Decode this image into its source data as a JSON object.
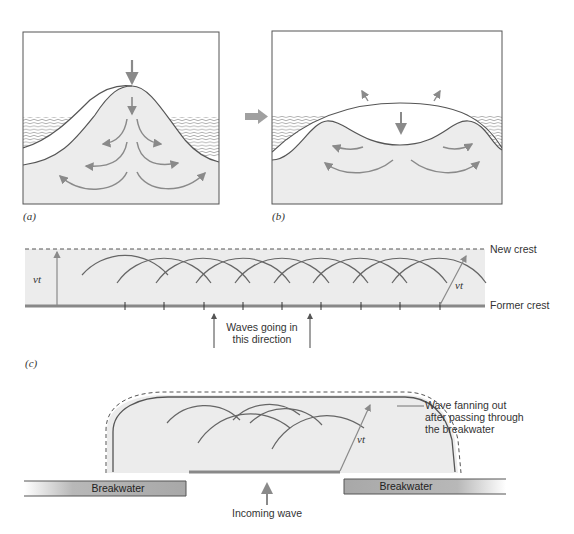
{
  "page_header": "",
  "colors": {
    "fill_light": "#eeeeee",
    "stroke_dark": "#555555",
    "arrow_gray": "#8a8a8a",
    "accent_arrow": "#9a9a9a"
  },
  "figures": {
    "a": {
      "caption": "(a)"
    },
    "b": {
      "caption": "(b)"
    },
    "c": {
      "caption": "(c)",
      "vt_left": "vt",
      "vt_right": "vt",
      "new_crest": "New crest",
      "former_crest": "Former crest",
      "direction_line1": "Waves going in",
      "direction_line2": "this direction"
    },
    "d": {
      "breakwater_left": "Breakwater",
      "breakwater_right": "Breakwater",
      "incoming_wave": "Incoming wave",
      "vt": "vt",
      "fanning_line1": "Wave fanning out",
      "fanning_line2": "after passing through",
      "fanning_line3": "the breakwater"
    }
  }
}
